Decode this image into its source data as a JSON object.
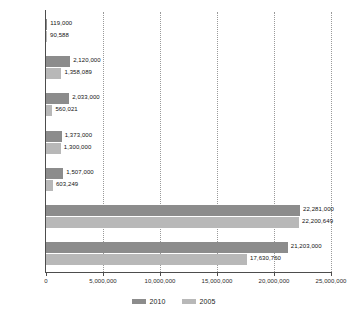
{
  "chart_data": {
    "type": "bar",
    "orientation": "horizontal",
    "title": "",
    "subtitle": "",
    "xlabel": "",
    "ylabel": "",
    "grid": true,
    "legend_position": "bottom",
    "xlim": [
      0,
      25000000
    ],
    "xticks": [
      0,
      5000000,
      10000000,
      15000000,
      20000000,
      25000000
    ],
    "xtick_labels": [
      "0",
      "5,000,000",
      "10,000,000",
      "15,000,000",
      "20,000,000",
      "25,000,000"
    ],
    "categories": [
      "Belarus",
      "Estonia",
      "Georgia",
      "Latvia",
      "Lithuania",
      "Russia",
      "Ukraine"
    ],
    "series": [
      {
        "name": "2010",
        "color": "#8c8c8c",
        "values": [
          119000,
          2120000,
          2033000,
          1373000,
          1507000,
          22281000,
          21203000
        ],
        "labels": [
          "119,000",
          "2,120,000",
          "2,033,000",
          "1,373,000",
          "1,507,000",
          "22,281,000",
          "21,203,000"
        ]
      },
      {
        "name": "2005",
        "color": "#b8b8b8",
        "values": [
          90588,
          1358089,
          560021,
          1300000,
          603249,
          22200649,
          17630760
        ],
        "labels": [
          "90,588",
          "1,358,089",
          "560,021",
          "1,300,000",
          "603,249",
          "22,200,649",
          "17,630,760"
        ]
      }
    ]
  },
  "legend": {
    "entries": [
      {
        "label": "2010"
      },
      {
        "label": "2005"
      }
    ]
  }
}
